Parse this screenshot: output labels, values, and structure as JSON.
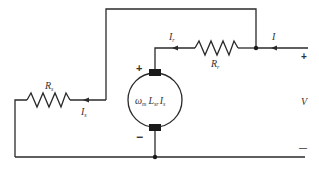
{
  "diagram": {
    "type": "circuit",
    "colors": {
      "wire": "#2a2a2a",
      "label": "#333333",
      "background": "#ffffff"
    },
    "labels": {
      "series_resistor": "R",
      "series_resistor_sub": "s",
      "series_current": "I",
      "series_current_sub": "s",
      "field_resistor": "R",
      "field_resistor_sub": "r",
      "field_current": "I",
      "field_current_sub": "r",
      "supply_current": "I",
      "terminal_voltage": "V",
      "terminal_plus": "+",
      "terminal_minus": "—",
      "motor_plus": "+",
      "motor_minus": "−",
      "emf_omega": "ω",
      "emf_omega_sub": "m",
      "emf_L": "L",
      "emf_L_sub": "sr",
      "emf_I": "I",
      "emf_I_sub": "s"
    }
  }
}
